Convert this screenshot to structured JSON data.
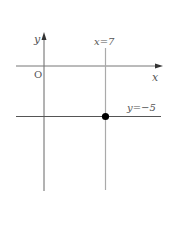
{
  "diagram": {
    "axes": {
      "x_label": "x",
      "y_label": "y",
      "origin_label": "O"
    },
    "lines": [
      {
        "equation": "x=7",
        "orientation": "vertical",
        "color": "#aaaaaa"
      },
      {
        "equation": "y=−5",
        "orientation": "horizontal",
        "color": "#555555"
      }
    ],
    "intersection_point": {
      "x": 7,
      "y": -5,
      "color": "#000000"
    },
    "colors": {
      "axis": "#666666",
      "label": "#555555"
    }
  }
}
